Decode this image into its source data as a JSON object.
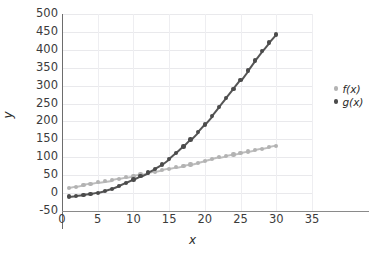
{
  "chart_data": {
    "type": "scatter",
    "title": "",
    "xlabel": "x",
    "ylabel": "y",
    "xlim": [
      0,
      35
    ],
    "ylim": [
      -50,
      500
    ],
    "xticks": [
      0,
      5,
      10,
      15,
      20,
      25,
      30,
      35
    ],
    "yticks": [
      -50,
      0,
      50,
      100,
      150,
      200,
      250,
      300,
      350,
      400,
      450,
      500
    ],
    "grid": true,
    "legend_position": "right",
    "x": [
      1,
      2,
      3,
      4,
      5,
      6,
      7,
      8,
      9,
      10,
      11,
      12,
      13,
      14,
      15,
      16,
      17,
      18,
      19,
      20,
      21,
      22,
      23,
      24,
      25,
      26,
      27,
      28,
      29,
      30
    ],
    "series": [
      {
        "name": "f(x)",
        "color": "#b3b3b3",
        "values": [
          14,
          18,
          22,
          26,
          30,
          33,
          36,
          40,
          44,
          48,
          52,
          56,
          60,
          64,
          68,
          72,
          76,
          80,
          85,
          90,
          95,
          100,
          104,
          108,
          112,
          116,
          120,
          124,
          128,
          132
        ]
      },
      {
        "name": "g(x)",
        "color": "#4b4b4b",
        "values": [
          -10,
          -8,
          -6,
          -3,
          1,
          6,
          12,
          20,
          29,
          38,
          47,
          57,
          68,
          80,
          95,
          112,
          130,
          150,
          170,
          192,
          215,
          240,
          265,
          290,
          315,
          342,
          370,
          396,
          420,
          443
        ]
      }
    ]
  },
  "legend": {
    "items": [
      {
        "label": "f(x)",
        "marker": "circle-marker-light"
      },
      {
        "label": "g(x)",
        "marker": "circle-marker-dark"
      }
    ]
  },
  "axes": {
    "x_title": "x",
    "y_title": "y",
    "x_tick_labels": [
      "0",
      "5",
      "10",
      "15",
      "20",
      "25",
      "30",
      "35"
    ],
    "y_tick_labels": [
      "500",
      "450",
      "400",
      "350",
      "300",
      "250",
      "200",
      "150",
      "100",
      "50",
      "0",
      "-50"
    ]
  },
  "colors": {
    "series_f": "#b3b3b3",
    "series_g": "#4b4b4b",
    "grid": "#e9e9ec",
    "axis": "#6d6d6d",
    "text": "#3b3b3b",
    "background": "#ffffff"
  }
}
